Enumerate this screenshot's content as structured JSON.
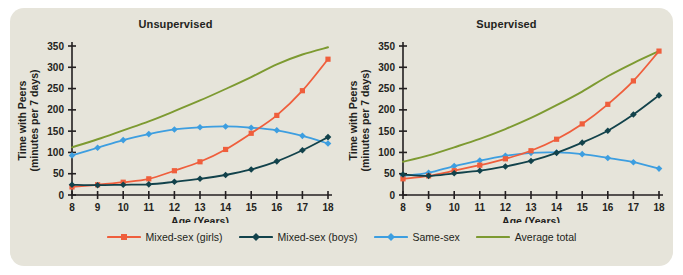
{
  "figure": {
    "background_color": "#e6e4da",
    "panels": [
      {
        "id": "unsupervised",
        "title": "Unsupervised",
        "xlabel": "Age (Years)",
        "ylabel_line1": "Time with Peers",
        "ylabel_line2": "(minutes per 7 days)"
      },
      {
        "id": "supervised",
        "title": "Supervised",
        "xlabel": "Age (Years)",
        "ylabel_line1": "Time with Peers",
        "ylabel_line2": "(minutes per 7 days)"
      }
    ]
  },
  "legend": {
    "position": "bottom-center",
    "items": [
      {
        "label": "Mixed-sex (girls)",
        "color": "#ef5e3c",
        "marker": "square"
      },
      {
        "label": "Mixed-sex (boys)",
        "color": "#12424b",
        "marker": "diamond"
      },
      {
        "label": "Same-sex",
        "color": "#3d9ee0",
        "marker": "diamond"
      },
      {
        "label": "Average total",
        "color": "#7d9a31",
        "marker": "none"
      }
    ]
  },
  "chart_data": [
    {
      "type": "line",
      "title": "Unsupervised",
      "xlabel": "Age (Years)",
      "ylabel": "Time with Peers (minutes per 7 days)",
      "x": [
        8,
        9,
        10,
        11,
        12,
        13,
        14,
        15,
        16,
        17,
        18
      ],
      "xticklabels": [
        "8",
        "9",
        "10",
        "11",
        "12",
        "13",
        "14",
        "15",
        "16",
        "17",
        "18"
      ],
      "yticks": [
        0,
        50,
        100,
        150,
        200,
        250,
        300,
        350
      ],
      "yticklabels": [
        "0",
        "50",
        "100",
        "150",
        "200",
        "250",
        "300",
        "350"
      ],
      "xlim": [
        8,
        18
      ],
      "ylim": [
        0,
        350
      ],
      "grid": false,
      "series": [
        {
          "name": "Mixed-sex (girls)",
          "color": "#ef5e3c",
          "marker": "square",
          "values": [
            19,
            24,
            30,
            38,
            57,
            78,
            107,
            145,
            187,
            245,
            319
          ]
        },
        {
          "name": "Mixed-sex (boys)",
          "color": "#12424b",
          "marker": "diamond",
          "values": [
            24,
            23,
            24,
            25,
            31,
            38,
            47,
            60,
            79,
            105,
            136
          ]
        },
        {
          "name": "Same-sex",
          "color": "#3d9ee0",
          "marker": "diamond",
          "values": [
            93,
            111,
            129,
            143,
            154,
            159,
            161,
            158,
            152,
            139,
            121
          ]
        },
        {
          "name": "Average total",
          "color": "#7d9a31",
          "marker": "none",
          "values": [
            112,
            131,
            152,
            173,
            197,
            222,
            249,
            277,
            307,
            330,
            347
          ]
        }
      ]
    },
    {
      "type": "line",
      "title": "Supervised",
      "xlabel": "Age (Years)",
      "ylabel": "Time with Peers (minutes per 7 days)",
      "x": [
        8,
        9,
        10,
        11,
        12,
        13,
        14,
        15,
        16,
        17,
        18
      ],
      "xticklabels": [
        "8",
        "9",
        "10",
        "11",
        "12",
        "13",
        "14",
        "15",
        "16",
        "17",
        "18"
      ],
      "yticks": [
        0,
        50,
        100,
        150,
        200,
        250,
        300,
        350
      ],
      "yticklabels": [
        "0",
        "50",
        "100",
        "150",
        "200",
        "250",
        "300",
        "350"
      ],
      "xlim": [
        8,
        18
      ],
      "ylim": [
        0,
        350
      ],
      "grid": false,
      "series": [
        {
          "name": "Mixed-sex (girls)",
          "color": "#ef5e3c",
          "marker": "square",
          "values": [
            38,
            45,
            57,
            70,
            85,
            104,
            131,
            167,
            213,
            268,
            338
          ]
        },
        {
          "name": "Mixed-sex (boys)",
          "color": "#12424b",
          "marker": "diamond",
          "values": [
            48,
            45,
            51,
            57,
            67,
            80,
            99,
            123,
            151,
            189,
            234
          ]
        },
        {
          "name": "Same-sex",
          "color": "#3d9ee0",
          "marker": "diamond",
          "values": [
            45,
            52,
            68,
            81,
            92,
            99,
            100,
            96,
            87,
            77,
            62
          ]
        },
        {
          "name": "Average total",
          "color": "#7d9a31",
          "marker": "none",
          "values": [
            78,
            93,
            112,
            132,
            155,
            181,
            211,
            243,
            279,
            310,
            338
          ]
        }
      ]
    }
  ]
}
